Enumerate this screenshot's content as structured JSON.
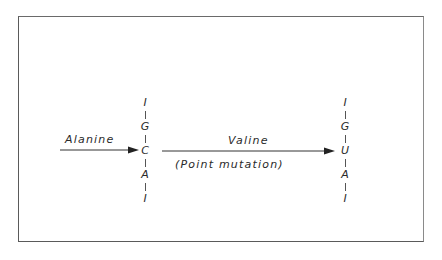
{
  "diagram": {
    "left_arrow_label": "Alanine",
    "middle_arrow_label": "Valine",
    "middle_arrow_sublabel": "(Point mutation)",
    "left_codon": {
      "bases": [
        "I",
        "G",
        "C",
        "A",
        "I"
      ]
    },
    "right_codon": {
      "bases": [
        "I",
        "G",
        "U",
        "A",
        "I"
      ]
    },
    "colors": {
      "ink": "#2a2a2a",
      "frame": "#5a5a5a",
      "background": "#ffffff"
    }
  }
}
